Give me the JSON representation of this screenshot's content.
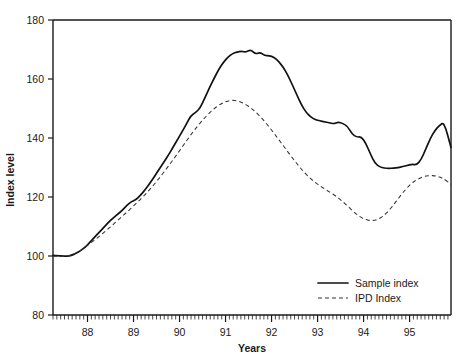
{
  "chart_data": {
    "type": "line",
    "title": "",
    "xlabel": "Years",
    "ylabel": "Index level",
    "xlim": [
      87.25,
      95.9
    ],
    "ylim": [
      80,
      180
    ],
    "ytick_labels": [
      "80",
      "100",
      "120",
      "140",
      "160",
      "180"
    ],
    "ytick_values": [
      80,
      100,
      120,
      140,
      160,
      180
    ],
    "xtick_labels": [
      "88",
      "89",
      "90",
      "91",
      "92",
      "93",
      "94",
      "95"
    ],
    "xtick_values": [
      88,
      89,
      90,
      91,
      92,
      93,
      94,
      95
    ],
    "minor_ticks_per_year": 12,
    "grid": false,
    "legend_position": "bottom-right",
    "x": [
      87.25,
      87.35,
      87.45,
      87.55,
      87.65,
      87.75,
      87.85,
      87.95,
      88.05,
      88.15,
      88.25,
      88.35,
      88.45,
      88.55,
      88.65,
      88.75,
      88.85,
      88.95,
      89.05,
      89.15,
      89.25,
      89.35,
      89.45,
      89.55,
      89.65,
      89.75,
      89.85,
      89.95,
      90.05,
      90.15,
      90.25,
      90.35,
      90.45,
      90.55,
      90.65,
      90.75,
      90.85,
      90.95,
      91.05,
      91.15,
      91.25,
      91.35,
      91.45,
      91.55,
      91.65,
      91.75,
      91.85,
      91.95,
      92.05,
      92.15,
      92.25,
      92.35,
      92.45,
      92.55,
      92.65,
      92.75,
      92.85,
      92.95,
      93.05,
      93.15,
      93.25,
      93.35,
      93.45,
      93.55,
      93.65,
      93.75,
      93.85,
      93.95,
      94.05,
      94.15,
      94.25,
      94.35,
      94.45,
      94.55,
      94.65,
      94.75,
      94.85,
      94.95,
      95.05,
      95.15,
      95.25,
      95.35,
      95.45,
      95.55,
      95.65,
      95.75,
      95.9
    ],
    "series": [
      {
        "name": "Sample index",
        "style": "solid",
        "values": [
          100.2,
          100.1,
          100.0,
          99.9,
          100.2,
          100.9,
          101.8,
          103.0,
          104.6,
          106.3,
          108.0,
          109.6,
          111.3,
          112.8,
          114.1,
          115.4,
          117.1,
          118.4,
          119.0,
          120.6,
          122.4,
          124.5,
          126.8,
          129.3,
          131.6,
          134.0,
          136.6,
          139.3,
          142.0,
          144.7,
          147.7,
          148.6,
          150.2,
          153.6,
          157.0,
          160.2,
          163.2,
          165.6,
          167.4,
          168.6,
          169.2,
          169.4,
          169.1,
          170.0,
          168.4,
          169.1,
          167.9,
          167.9,
          167.4,
          166.0,
          164.1,
          161.4,
          158.1,
          154.6,
          151.2,
          148.7,
          147.1,
          146.2,
          145.8,
          145.5,
          145.2,
          144.8,
          145.4,
          144.9,
          144.0,
          141.3,
          140.3,
          140.4,
          138.2,
          134.5,
          131.4,
          130.2,
          129.8,
          129.7,
          129.8,
          130.0,
          130.3,
          130.7,
          131.1,
          130.9,
          132.6,
          136.2,
          139.8,
          142.6,
          144.3,
          145.4,
          136.8
        ]
      },
      {
        "name": "IPD Index",
        "style": "dashed",
        "values": [
          99.9,
          99.9,
          99.8,
          99.9,
          100.3,
          101.0,
          101.9,
          103.0,
          104.2,
          105.4,
          106.6,
          107.9,
          109.2,
          110.6,
          112.0,
          113.4,
          114.8,
          116.2,
          117.7,
          119.2,
          120.8,
          122.5,
          124.3,
          126.2,
          128.2,
          130.3,
          132.4,
          134.6,
          136.8,
          139.0,
          141.2,
          143.2,
          145.1,
          146.9,
          148.5,
          149.9,
          151.1,
          152.0,
          152.6,
          152.8,
          152.6,
          152.1,
          151.3,
          150.2,
          148.9,
          147.3,
          145.6,
          143.7,
          141.7,
          139.6,
          137.5,
          135.4,
          133.3,
          131.3,
          129.4,
          127.7,
          126.2,
          124.9,
          123.8,
          122.8,
          121.8,
          120.8,
          119.7,
          118.4,
          117.0,
          115.5,
          114.1,
          113.0,
          112.3,
          112.0,
          112.1,
          112.7,
          113.8,
          115.4,
          117.3,
          119.4,
          121.4,
          123.2,
          124.7,
          125.8,
          126.6,
          127.1,
          127.3,
          127.2,
          126.8,
          126.1,
          124.3
        ]
      }
    ]
  },
  "legend": {
    "entries": [
      {
        "label": "Sample index",
        "style": "solid"
      },
      {
        "label": "IPD Index",
        "style": "dashed"
      }
    ]
  },
  "axes": {
    "y_title": "Index level",
    "x_title": "Years"
  }
}
